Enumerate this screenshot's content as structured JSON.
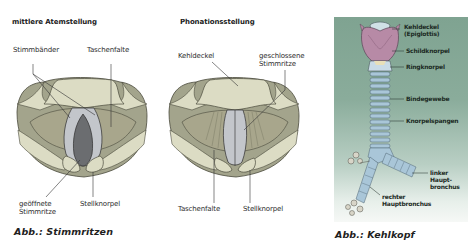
{
  "figures": {
    "stimmritzen": {
      "caption": "Abb.: Stimmritzen",
      "left_diagram": {
        "title": "mittlere Atemstellung",
        "labels": {
          "stimmbaender": "Stimmbänder",
          "taschenfalte": "Taschenfalte",
          "geoeffnete_line1": "geöffnete",
          "geoeffnete_line2": "Stimmritze",
          "stellknorpel": "Stellknorpel"
        }
      },
      "right_diagram": {
        "title": "Phonationsstellung",
        "labels": {
          "kehldeckel": "Kehldeckel",
          "geschlossene_line1": "geschlossene",
          "geschlossene_line2": "Stimmritze",
          "taschenfalte": "Taschenfalte",
          "stellknorpel": "Stellknorpel"
        }
      }
    },
    "kehlkopf": {
      "caption": "Abb.: Kehlkopf",
      "labels": {
        "kehldeckel_line1": "Kehldeckel",
        "kehldeckel_line2": "(Epiglottis)",
        "schildknorpel": "Schildknorpel",
        "ringknorpel": "Ringknorpel",
        "bindegewebe": "Bindegewebe",
        "knorpelspangen": "Knorpelspangen",
        "linker_line1": "linker",
        "linker_line2": "Haupt-",
        "linker_line3": "bronchus",
        "rechter_line1": "rechter",
        "rechter_line2": "Hauptbronchus"
      }
    }
  },
  "colors": {
    "outer_tissue": "#a3a48c",
    "pale_tissue": "#dcdcc4",
    "vocal_cord": "#c3c6cb",
    "open_glottis": "#6b6d70",
    "panel_green": "#7fa391",
    "thyroid_pink": "#b78aa6",
    "trachea_blue": "#a9c6d8"
  }
}
